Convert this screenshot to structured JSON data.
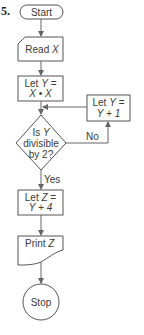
{
  "problem_number": "5.",
  "nodes": {
    "start": {
      "label": "Start"
    },
    "read": {
      "label_prefix": "Read ",
      "var": "X"
    },
    "let_y": {
      "line1_prefix": "Let ",
      "line1_var": "Y",
      "line1_suffix": " =",
      "line2": "X • X"
    },
    "increment": {
      "line1_prefix": "Let ",
      "line1_var": "Y",
      "line1_suffix": " =",
      "line2": "Y + 1"
    },
    "decision": {
      "line1_prefix": "Is ",
      "line1_var": "Y",
      "line2": "divisible",
      "line3": "by 2?"
    },
    "let_z": {
      "line1_prefix": "Let ",
      "line1_var": "Z",
      "line1_suffix": " =",
      "line2": "Y + 4"
    },
    "print": {
      "label_prefix": "Print ",
      "var": "Z"
    },
    "stop": {
      "label": "Stop"
    }
  },
  "edges": {
    "yes_label": "Yes",
    "no_label": "No"
  }
}
